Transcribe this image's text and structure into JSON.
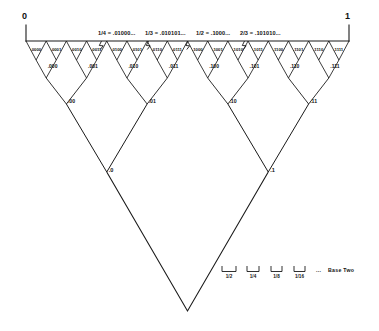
{
  "diagram": {
    "endpoints": {
      "left": "0",
      "right": "1"
    },
    "fraction_notes": [
      {
        "text": "1/4 = .01000...",
        "x": 98,
        "y": 31,
        "tick_x": 101.5
      },
      {
        "text": "1/3 = .010101...",
        "x": 145,
        "y": 31,
        "tick_x": 148.5
      },
      {
        "text": "1/2 = .1000...",
        "x": 196,
        "y": 31,
        "tick_x": 188.0
      },
      {
        "text": "2/3 = .101010...",
        "x": 240,
        "y": 31,
        "tick_x": 244.5
      }
    ],
    "levels": {
      "level4": {
        "name": "four-bit-expansions",
        "labels": [
          ".0000",
          ".0001",
          ".0010",
          ".0011",
          ".0100",
          ".0101",
          ".0110",
          ".0111",
          ".1000",
          ".1001",
          ".1010",
          ".1011",
          ".1100",
          ".1101",
          ".1110",
          ".1111"
        ]
      },
      "level3": {
        "name": "three-bit-expansions",
        "labels": [
          ".000",
          ".001",
          ".010",
          ".011",
          ".100",
          ".101",
          ".110",
          ".111"
        ]
      },
      "level2": {
        "name": "two-bit-expansions",
        "labels": [
          ".00",
          ".01",
          ".10",
          ".11"
        ]
      },
      "level1": {
        "name": "one-bit-expansions",
        "labels": [
          ".0",
          ".1"
        ]
      }
    },
    "legend": {
      "brackets": [
        "1/2",
        "1/4",
        "1/8",
        "1/16"
      ],
      "ellipsis": "...",
      "caption": "Base Two"
    },
    "colors": {
      "stroke": "#1a1a1a",
      "background": "#ffffff",
      "text": "#111111"
    }
  }
}
